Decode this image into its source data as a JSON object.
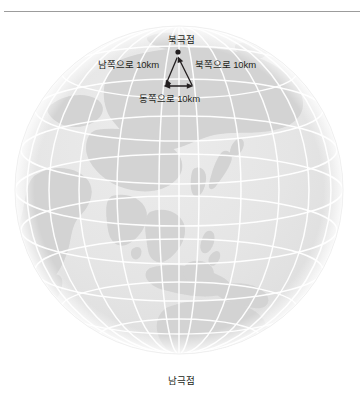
{
  "figure": {
    "title_alt": "북극점 삼각 경로 다이어그램",
    "divider": true
  },
  "labels": {
    "north_pole": "북극점",
    "south_pole": "남극점",
    "leg_south": "남쪽으로 10km",
    "leg_north": "북쪽으로 10km",
    "leg_east": "동쪽으로 10km"
  },
  "colors": {
    "ocean": "#e4e4e4",
    "land": "#d2d2d2",
    "graticule": "#ffffff",
    "outline": "#f2f2f2",
    "text": "#231f20",
    "rule": "#9c9c9c",
    "arrow": "#231f20",
    "page": "#ffffff"
  },
  "globe": {
    "center_x": 179,
    "center_y": 190,
    "radius": 164,
    "meridian_count": 12,
    "parallel_count": 8
  },
  "path_diagram": {
    "pole_dot": {
      "x": 178,
      "y": 52,
      "r": 2.6
    },
    "apex": {
      "x": 178,
      "y": 58
    },
    "bottom_left": {
      "x": 165,
      "y": 86
    },
    "bottom_right": {
      "x": 192,
      "y": 86
    },
    "legs": [
      {
        "name": "south",
        "from": "apex",
        "to": "bottom_left",
        "arrow_at": "end"
      },
      {
        "name": "east",
        "from": "bottom_left",
        "to": "bottom_right",
        "arrow_at": "both"
      },
      {
        "name": "north",
        "from": "bottom_right",
        "to": "apex",
        "arrow_at": "end"
      }
    ],
    "distance_km": 10
  }
}
